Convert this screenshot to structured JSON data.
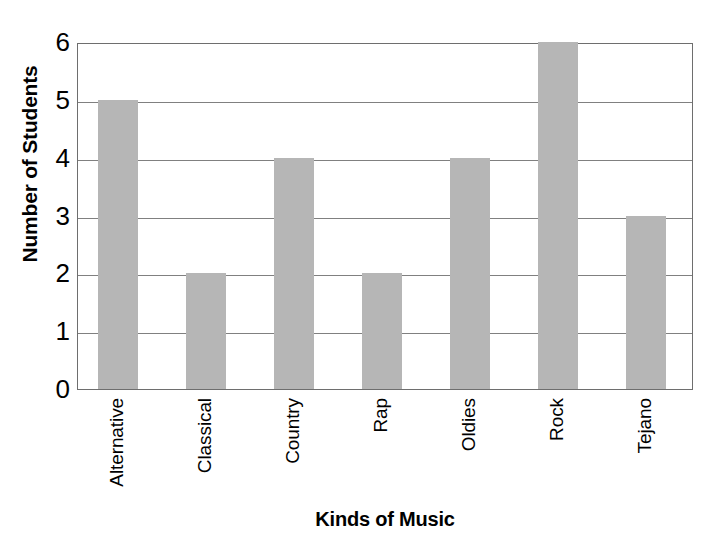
{
  "chart_data": {
    "type": "bar",
    "title": "",
    "xlabel": "Kinds of Music",
    "ylabel": "Number of Students",
    "categories": [
      "Alternative",
      "Classical",
      "Country",
      "Rap",
      "Oldies",
      "Rock",
      "Tejano"
    ],
    "values": [
      5,
      2,
      4,
      2,
      4,
      6,
      3
    ],
    "ylim": [
      0,
      6
    ],
    "yticks": [
      0,
      1,
      2,
      3,
      4,
      5,
      6
    ],
    "ytick_labels": [
      "0",
      "1",
      "2",
      "3",
      "4",
      "5",
      "6"
    ],
    "grid": "horizontal",
    "legend": "none",
    "bar_color": "#b6b6b6",
    "frame_color": "#6e6e6e",
    "gridline_color": "#808080",
    "text_color": "#000000",
    "background": "#ffffff"
  }
}
